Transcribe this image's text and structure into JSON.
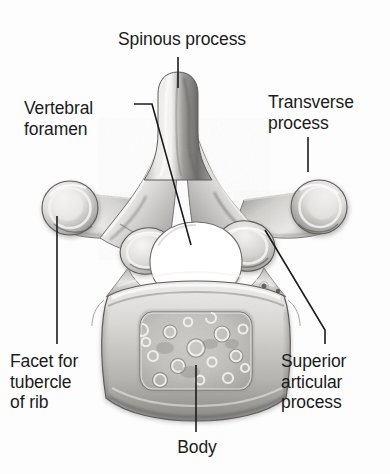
{
  "figure": {
    "background_color": "#fdfdfd",
    "ink_color": "#1b1b1b",
    "bone_light": "#f2f1ef",
    "bone_mid": "#c9c7c4",
    "bone_dark": "#8e8b88",
    "bone_shadow": "#5f5d5b",
    "foramen_color": "#ffffff"
  },
  "labels": {
    "spinous_process": "Spinous process",
    "vertebral_foramen_line1": "Vertebral",
    "vertebral_foramen_line2": "foramen",
    "transverse_process_line1": "Transverse",
    "transverse_process_line2": "process",
    "facet_tubercle_line1": "Facet for",
    "facet_tubercle_line2": "tubercle",
    "facet_tubercle_line3": "of rib",
    "superior_articular_line1": "Superior",
    "superior_articular_line2": "articular",
    "superior_articular_line3": "process",
    "body": "Body"
  },
  "leader_lines": [
    {
      "name": "spinous-process-leader",
      "points": "178,57 178,88"
    },
    {
      "name": "vertebral-foramen-leader",
      "points": "134,104 152,104 191,245"
    },
    {
      "name": "transverse-process-leader",
      "points": "308,137 308,172"
    },
    {
      "name": "facet-tubercle-leader",
      "points": "57,216 57,344"
    },
    {
      "name": "superior-articular-leader",
      "points": "265,230 325,330 325,344"
    },
    {
      "name": "body-leader",
      "points": "196,365 196,432"
    }
  ]
}
